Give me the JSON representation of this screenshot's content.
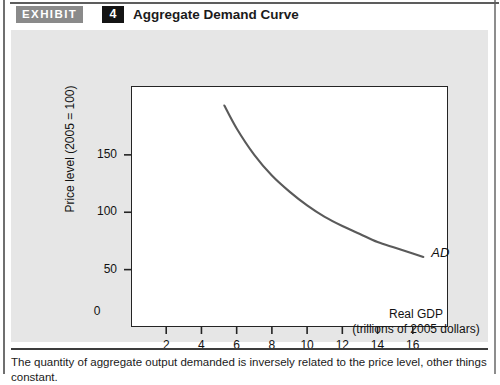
{
  "header": {
    "exhibit_label": "EXHIBIT",
    "exhibit_number": "4",
    "title": "Aggregate Demand Curve"
  },
  "caption": "The quantity of aggregate output demanded is inversely related to the price level, other things constant.",
  "colors": {
    "panel_background": "#e6e6e6",
    "exhibit_tag_background": "#8a8a8a",
    "exhibit_number_background": "#141414",
    "curve": "#5a5a5a",
    "axis": "#242424"
  },
  "chart_data": {
    "type": "line",
    "title": "Aggregate Demand Curve",
    "xlabel": "Real GDP",
    "xlabel_sub": "(trillions of 2005 dollars)",
    "ylabel": "Price level (2005 = 100)",
    "origin_label": "0",
    "xticks": [
      2,
      4,
      6,
      8,
      10,
      12,
      14,
      16
    ],
    "xtick_labels": [
      "2",
      "4",
      "6",
      "8",
      "10",
      "12",
      "14",
      "16"
    ],
    "yticks": [
      50,
      100,
      150
    ],
    "ytick_labels": [
      "50",
      "100",
      "150"
    ],
    "xlim": [
      0,
      18
    ],
    "ylim": [
      0,
      210
    ],
    "grid": false,
    "legend": "none",
    "series": [
      {
        "name": "AD",
        "annotation": "AD",
        "x": [
          5.3,
          6.0,
          7.0,
          8.0,
          9.0,
          10.0,
          11.0,
          12.0,
          13.0,
          14.0,
          15.0,
          16.0,
          16.6
        ],
        "y": [
          193,
          173,
          150,
          132,
          118,
          106,
          96,
          88,
          81,
          74,
          69,
          64,
          61
        ]
      }
    ]
  }
}
